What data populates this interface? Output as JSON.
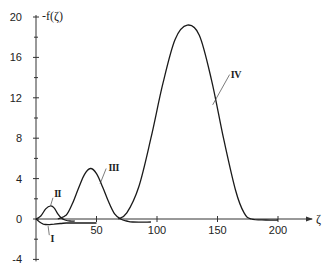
{
  "chart_data": {
    "type": "line",
    "title": "",
    "xlabel": "ζ",
    "ylabel": "-f(ζ)",
    "xlim": [
      0,
      225
    ],
    "ylim": [
      -4,
      20
    ],
    "grid": false,
    "legend": "none (curves labeled inline with Roman numerals)",
    "x_ticks": [
      50,
      100,
      150,
      200
    ],
    "x_tick_labels": [
      "50",
      "100",
      "150",
      "200"
    ],
    "y_ticks": [
      -4,
      0,
      4,
      8,
      12,
      16,
      20
    ],
    "y_tick_labels": [
      "-4",
      "0",
      "4",
      "8",
      "12",
      "16",
      "20"
    ],
    "y_minor_ticks": [
      -2,
      2,
      6,
      10,
      14,
      18
    ],
    "series": [
      {
        "name": "I",
        "x": [
          0,
          3,
          6,
          10,
          15,
          20,
          25,
          30,
          40,
          50
        ],
        "y": [
          0,
          -0.3,
          -0.5,
          -0.55,
          -0.5,
          -0.45,
          -0.4,
          -0.4,
          -0.4,
          -0.4
        ]
      },
      {
        "name": "II",
        "x": [
          0,
          4,
          8,
          12,
          15,
          18,
          21,
          24,
          28,
          32
        ],
        "y": [
          0,
          0.3,
          1.0,
          1.3,
          1.1,
          0.5,
          0.1,
          -0.1,
          -0.2,
          -0.2
        ]
      },
      {
        "name": "III",
        "x": [
          18,
          25,
          30,
          35,
          40,
          45,
          50,
          55,
          60,
          65,
          70,
          75,
          80,
          95
        ],
        "y": [
          0,
          0.4,
          1.5,
          3.0,
          4.4,
          5.0,
          4.5,
          3.2,
          1.7,
          0.5,
          0,
          -0.2,
          -0.3,
          -0.3
        ]
      },
      {
        "name": "IV",
        "x": [
          68,
          75,
          85,
          95,
          105,
          115,
          125,
          135,
          145,
          155,
          165,
          172,
          178,
          190,
          200
        ],
        "y": [
          0,
          0.6,
          3.2,
          8.0,
          13.5,
          17.8,
          19.2,
          18.2,
          13.8,
          8.0,
          2.8,
          0.6,
          0,
          -0.1,
          -0.1
        ]
      }
    ],
    "annotations": [
      {
        "text": "I",
        "near_x": 12,
        "near_y": -1.5
      },
      {
        "text": "II",
        "near_x": 15,
        "near_y": 2.3
      },
      {
        "text": "III",
        "near_x": 60,
        "near_y": 5.1
      },
      {
        "text": "IV",
        "near_x": 160,
        "near_y": 14.2
      }
    ]
  },
  "labels": {
    "ylabel": "-f(ζ)",
    "xlabel": "ζ",
    "curve_I": "I",
    "curve_II": "II",
    "curve_III": "III",
    "curve_IV": "IV"
  }
}
